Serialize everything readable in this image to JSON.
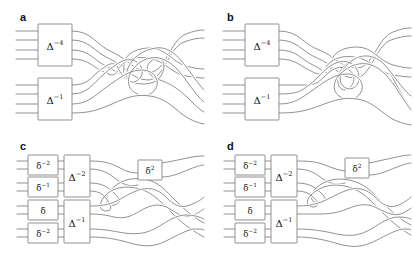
{
  "figure": {
    "type": "braid-diagram-grid",
    "background_color": "#ffffff",
    "strand_color": "#7d7d7d",
    "label_color": "#111111",
    "columns": 2,
    "rows": 2,
    "strand_count": 8
  },
  "panels": [
    {
      "letter": "a",
      "id": "panel-a",
      "boxes": [
        {
          "name": "delta-inv-4",
          "base": "Δ",
          "exponent": "−4",
          "size": "large",
          "inputs": 4,
          "outputs": 4
        },
        {
          "name": "delta-inv-1",
          "base": "Δ",
          "exponent": "−1",
          "size": "large",
          "inputs": 4,
          "outputs": 4
        }
      ]
    },
    {
      "letter": "b",
      "id": "panel-b",
      "boxes": [
        {
          "name": "delta-inv-4",
          "base": "Δ",
          "exponent": "−4",
          "size": "large",
          "inputs": 4,
          "outputs": 4
        },
        {
          "name": "delta-inv-1",
          "base": "Δ",
          "exponent": "−1",
          "size": "large",
          "inputs": 4,
          "outputs": 4
        }
      ]
    },
    {
      "letter": "c",
      "id": "panel-c",
      "boxes": [
        {
          "name": "small-delta-inv-2-top",
          "base": "δ",
          "exponent": "−2",
          "size": "small",
          "inputs": 2,
          "outputs": 2
        },
        {
          "name": "small-delta-inv-1",
          "base": "δ",
          "exponent": "−1",
          "size": "small",
          "inputs": 2,
          "outputs": 2
        },
        {
          "name": "delta-inv-2",
          "base": "Δ",
          "exponent": "−2",
          "size": "large",
          "inputs": 4,
          "outputs": 4
        },
        {
          "name": "small-delta",
          "base": "δ",
          "exponent": "",
          "size": "small",
          "inputs": 2,
          "outputs": 2
        },
        {
          "name": "small-delta-inv-2-bottom",
          "base": "δ",
          "exponent": "−2",
          "size": "small",
          "inputs": 2,
          "outputs": 2
        },
        {
          "name": "delta-inv-1",
          "base": "Δ",
          "exponent": "−1",
          "size": "large",
          "inputs": 4,
          "outputs": 4
        },
        {
          "name": "small-delta-2",
          "base": "δ",
          "exponent": "2",
          "size": "small",
          "inputs": 2,
          "outputs": 2
        }
      ]
    },
    {
      "letter": "d",
      "id": "panel-d",
      "boxes": [
        {
          "name": "small-delta-inv-2-top",
          "base": "δ",
          "exponent": "−2",
          "size": "small",
          "inputs": 2,
          "outputs": 2
        },
        {
          "name": "small-delta-inv-1",
          "base": "δ",
          "exponent": "−1",
          "size": "small",
          "inputs": 2,
          "outputs": 2
        },
        {
          "name": "delta-inv-2",
          "base": "Δ",
          "exponent": "−2",
          "size": "large",
          "inputs": 4,
          "outputs": 4
        },
        {
          "name": "small-delta",
          "base": "δ",
          "exponent": "",
          "size": "small",
          "inputs": 2,
          "outputs": 2
        },
        {
          "name": "small-delta-inv-2-bottom",
          "base": "δ",
          "exponent": "−2",
          "size": "small",
          "inputs": 2,
          "outputs": 2
        },
        {
          "name": "delta-inv-1",
          "base": "Δ",
          "exponent": "−1",
          "size": "large",
          "inputs": 4,
          "outputs": 4
        },
        {
          "name": "small-delta-2",
          "base": "δ",
          "exponent": "2",
          "size": "small",
          "inputs": 2,
          "outputs": 2
        }
      ]
    }
  ]
}
